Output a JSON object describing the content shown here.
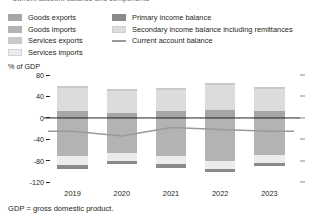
{
  "title": "Current account balance and components",
  "axis_unit": "% of GDP",
  "footnote": "GDP = gross domestic product.",
  "legend": {
    "left_column": [
      {
        "label": "Goods exports",
        "color": "#a6a6a6",
        "icon": "color-swatch"
      },
      {
        "label": "Goods imports",
        "color": "#b3b3b3",
        "icon": "color-swatch"
      },
      {
        "label": "Services exports",
        "color": "#c9c9c9",
        "icon": "color-swatch"
      },
      {
        "label": "Services imports",
        "color": "#ececec",
        "icon": "color-swatch"
      }
    ],
    "right_column": [
      {
        "label": "Primary income balance",
        "color": "#8a8a8a",
        "icon": "color-swatch"
      },
      {
        "label": "Secondary income balance including remittances",
        "color": "#dcdcdc",
        "icon": "color-swatch"
      },
      {
        "label": "Current account balance",
        "color": "#9a9a9a",
        "icon": "line-swatch"
      }
    ]
  },
  "chart_data": {
    "type": "bar",
    "title": "Current account balance and components",
    "xlabel": "",
    "ylabel": "% of GDP",
    "ylim": [
      -120,
      80
    ],
    "yticks": [
      80,
      40,
      0,
      -40,
      -80,
      -120
    ],
    "ytick_labels": [
      "80",
      "40",
      "0",
      "-40",
      "-80",
      "-120"
    ],
    "grid": false,
    "legend_position": "top",
    "stacked": true,
    "categories": [
      "2019",
      "2020",
      "2021",
      "2022",
      "2023"
    ],
    "series": [
      {
        "name": "Goods exports",
        "color": "#a6a6a6",
        "values": [
          12,
          9,
          12,
          14,
          12
        ]
      },
      {
        "name": "Secondary income balance including remittances",
        "color": "#dcdcdc",
        "values": [
          44,
          42,
          40,
          47,
          42
        ]
      },
      {
        "name": "Services exports",
        "color": "#c9c9c9",
        "values": [
          3,
          2,
          3,
          4,
          3
        ]
      },
      {
        "name": "Goods imports",
        "color": "#b3b3b3",
        "values": [
          -72,
          -66,
          -72,
          -80,
          -70
        ]
      },
      {
        "name": "Services imports",
        "color": "#ececec",
        "values": [
          -16,
          -14,
          -15,
          -15,
          -14
        ]
      },
      {
        "name": "Primary income balance",
        "color": "#8a8a8a",
        "values": [
          -7,
          -6,
          -6,
          -7,
          -6
        ]
      }
    ],
    "line_series": {
      "name": "Current account balance",
      "color": "#9a9a9a",
      "values": [
        -25,
        -34,
        -18,
        -22,
        -25
      ]
    }
  }
}
